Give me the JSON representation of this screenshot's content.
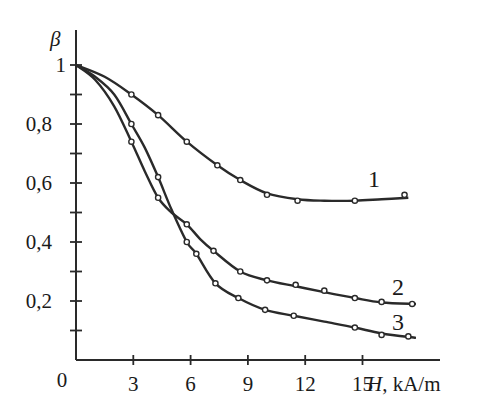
{
  "chart_data": {
    "type": "line",
    "title": "",
    "xlabel_var": "H",
    "xlabel_unit": ", kA/m",
    "ylabel": "β",
    "xlim": [
      0,
      18
    ],
    "ylim": [
      0,
      1.05
    ],
    "grid": false,
    "legend": "inline numeric labels at curve ends",
    "x_ticks": [
      0,
      3,
      6,
      9,
      12,
      15
    ],
    "x_tick_labels": [
      "0",
      "3",
      "6",
      "9",
      "12",
      "15"
    ],
    "y_ticks": [
      0.2,
      0.4,
      0.6,
      0.8,
      1.0
    ],
    "y_tick_labels": [
      "0,2",
      "0,4",
      "0,6",
      "0,8",
      "1"
    ],
    "y_minor_ticks": [
      0.1,
      0.3,
      0.5,
      0.7,
      0.9
    ],
    "series": [
      {
        "name": "1",
        "markers": [
          [
            2.9,
            0.9
          ],
          [
            4.3,
            0.83
          ],
          [
            5.8,
            0.74
          ],
          [
            7.4,
            0.66
          ],
          [
            8.6,
            0.61
          ],
          [
            10.0,
            0.56
          ],
          [
            11.6,
            0.54
          ],
          [
            14.6,
            0.54
          ],
          [
            17.2,
            0.56
          ]
        ],
        "curve": [
          [
            0,
            1.0
          ],
          [
            1.5,
            0.96
          ],
          [
            2.9,
            0.9
          ],
          [
            4.3,
            0.83
          ],
          [
            5.8,
            0.74
          ],
          [
            7.4,
            0.66
          ],
          [
            8.6,
            0.61
          ],
          [
            10.0,
            0.565
          ],
          [
            11.6,
            0.545
          ],
          [
            13.0,
            0.54
          ],
          [
            14.6,
            0.54
          ],
          [
            16.0,
            0.545
          ],
          [
            17.4,
            0.55
          ]
        ]
      },
      {
        "name": "2",
        "markers": [
          [
            2.9,
            0.74
          ],
          [
            4.3,
            0.55
          ],
          [
            5.8,
            0.46
          ],
          [
            7.2,
            0.37
          ],
          [
            8.6,
            0.3
          ],
          [
            10.0,
            0.27
          ],
          [
            11.5,
            0.255
          ],
          [
            13.0,
            0.235
          ],
          [
            14.6,
            0.21
          ],
          [
            16.0,
            0.197
          ],
          [
            17.6,
            0.19
          ]
        ],
        "curve": [
          [
            0,
            1.0
          ],
          [
            1.0,
            0.95
          ],
          [
            2.0,
            0.86
          ],
          [
            2.9,
            0.74
          ],
          [
            3.6,
            0.64
          ],
          [
            4.3,
            0.55
          ],
          [
            5.0,
            0.5
          ],
          [
            5.8,
            0.46
          ],
          [
            6.5,
            0.41
          ],
          [
            7.2,
            0.37
          ],
          [
            8.6,
            0.3
          ],
          [
            10.0,
            0.27
          ],
          [
            11.5,
            0.25
          ],
          [
            13.0,
            0.23
          ],
          [
            14.6,
            0.21
          ],
          [
            16.0,
            0.195
          ],
          [
            17.8,
            0.19
          ]
        ]
      },
      {
        "name": "3",
        "markers": [
          [
            2.9,
            0.8
          ],
          [
            4.3,
            0.62
          ],
          [
            5.8,
            0.4
          ],
          [
            6.3,
            0.36
          ],
          [
            7.3,
            0.26
          ],
          [
            8.5,
            0.21
          ],
          [
            9.9,
            0.17
          ],
          [
            11.4,
            0.15
          ],
          [
            14.6,
            0.11
          ],
          [
            16.0,
            0.085
          ],
          [
            17.4,
            0.08
          ]
        ],
        "curve": [
          [
            0,
            1.0
          ],
          [
            1.0,
            0.96
          ],
          [
            2.0,
            0.9
          ],
          [
            2.9,
            0.8
          ],
          [
            3.6,
            0.72
          ],
          [
            4.3,
            0.62
          ],
          [
            5.0,
            0.51
          ],
          [
            5.8,
            0.4
          ],
          [
            6.3,
            0.36
          ],
          [
            7.3,
            0.26
          ],
          [
            8.5,
            0.21
          ],
          [
            9.9,
            0.17
          ],
          [
            11.4,
            0.15
          ],
          [
            13.0,
            0.13
          ],
          [
            14.6,
            0.11
          ],
          [
            16.0,
            0.09
          ],
          [
            17.8,
            0.075
          ]
        ]
      }
    ]
  },
  "labels": {
    "y_axis_symbol": "β",
    "x_axis_var": "H",
    "x_axis_unit": ", kA/m",
    "origin": "0",
    "curve_1": "1",
    "curve_2": "2",
    "curve_3": "3"
  },
  "colors": {
    "line": "#2a2a2a",
    "background": "#ffffff"
  }
}
